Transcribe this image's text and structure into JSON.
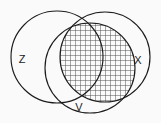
{
  "figure": {
    "kind": "venn-diagram",
    "title": "",
    "width": 161,
    "height": 123,
    "background_color": "#fafafa",
    "stroke_color": "#1c1c1c",
    "hatch_color": "#4a4a4a",
    "label_color": "#1a1a1a"
  },
  "sets": [
    {
      "id": "z",
      "label": "Z",
      "label_x": 22,
      "label_y": 60,
      "center_x": 57,
      "center_y": 57,
      "radius": 46
    },
    {
      "id": "v",
      "label": "V",
      "label_x": 79,
      "label_y": 108,
      "center_x": 90,
      "center_y": 68,
      "radius": 45
    },
    {
      "id": "x",
      "label": "X",
      "label_x": 138,
      "label_y": 61,
      "center_x": 105,
      "center_y": 57,
      "radius": 45
    }
  ],
  "shading": {
    "description": "V intersect X",
    "shaded_sets": [
      "v",
      "x"
    ],
    "pattern": "crosshatch-grid",
    "pattern_spacing_px": 5,
    "pattern_color": "#4a4a4a"
  }
}
